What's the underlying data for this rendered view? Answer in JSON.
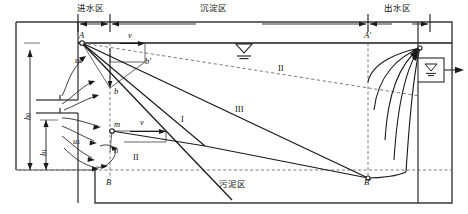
{
  "figure": {
    "type": "engineering-schematic",
    "zones": [
      {
        "id": "inlet",
        "label": "进水区",
        "x_range": [
          78,
          110
        ]
      },
      {
        "id": "sedimentation",
        "label": "沉淀区",
        "x_range": [
          110,
          368
        ]
      },
      {
        "id": "outlet",
        "label": "出水区",
        "x_range": [
          368,
          430
        ]
      },
      {
        "id": "sludge",
        "label": "污泥区",
        "x_range": [
          110,
          368
        ]
      }
    ],
    "points": {
      "A": {
        "label": "A",
        "x": 82,
        "y": 43
      },
      "Ap": {
        "label": "A'",
        "x": 368,
        "y": 43
      },
      "B": {
        "label": "B",
        "x": 110,
        "y": 180
      },
      "Bp": {
        "label": "B'",
        "x": 368,
        "y": 180
      },
      "b": {
        "label": "b",
        "x": 110,
        "y": 88
      },
      "bp": {
        "label": "b'",
        "x": 145,
        "y": 62
      },
      "m": {
        "label": "m",
        "x": 110,
        "y": 124
      },
      "n": {
        "label": "n",
        "x": 110,
        "y": 152
      }
    },
    "velocity_labels": [
      {
        "id": "u0",
        "base": "u",
        "sub": "0",
        "x": 80,
        "y": 61,
        "meaning": "settling-velocity-at-A"
      },
      {
        "id": "u1",
        "base": "u",
        "sub": "1",
        "x": 78,
        "y": 142,
        "meaning": "settling-velocity-at-m"
      },
      {
        "id": "v_top",
        "base": "v",
        "sub": "",
        "x": 131,
        "y": 40,
        "meaning": "horizontal-flow-velocity-top"
      },
      {
        "id": "v_middle",
        "base": "v",
        "sub": "",
        "x": 131,
        "y": 122,
        "meaning": "horizontal-flow-velocity-middle"
      }
    ],
    "depth_labels": [
      {
        "id": "h0",
        "base": "h",
        "sub": "0",
        "x": 25,
        "y": 118,
        "meaning": "effective-settling-depth"
      },
      {
        "id": "h1",
        "base": "h",
        "sub": "1",
        "x": 41,
        "y": 155,
        "meaning": "lower-inlet-depth"
      }
    ],
    "trajectory_labels": [
      {
        "id": "I",
        "text": "I",
        "x": 183,
        "y": 120
      },
      {
        "id": "II_low",
        "text": "II",
        "x": 136,
        "y": 158
      },
      {
        "id": "II_up",
        "text": "II",
        "x": 281,
        "y": 69
      },
      {
        "id": "III",
        "text": "III",
        "x": 239,
        "y": 110
      }
    ],
    "symbols": [
      {
        "id": "water-level-surface",
        "name": "water-level-icon",
        "x": 244,
        "y": 47
      },
      {
        "id": "water-level-outlet",
        "name": "water-level-icon",
        "x": 430,
        "y": 70
      }
    ],
    "colors": {
      "line": "#1a1a1a",
      "dashed": "#6b6b6b",
      "tank": "#3a3a3a",
      "text": "#111111",
      "bg": "#ffffff"
    },
    "dimension_arrows": {
      "top_inlet": {
        "from_x": 78,
        "to_x": 110
      },
      "top_settle": {
        "from_x": 110,
        "to_x": 368
      },
      "top_outlet": {
        "from_x": 368,
        "to_x": 430
      }
    }
  }
}
